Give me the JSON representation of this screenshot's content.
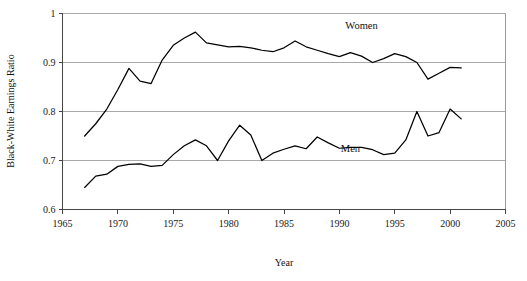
{
  "chart_data": {
    "type": "line",
    "title": "",
    "xlabel": "Year",
    "ylabel": "Black-White Earnings Ratio",
    "xlim": [
      1965,
      2005
    ],
    "ylim": [
      0.6,
      1.0
    ],
    "xticks": [
      1965,
      1970,
      1975,
      1980,
      1985,
      1990,
      1995,
      2000,
      2005
    ],
    "xtick_labels": [
      "1965",
      "1970",
      "1975",
      "1980",
      "1985",
      "1990",
      "1995",
      "2000",
      "2005"
    ],
    "yticks": [
      0.6,
      0.7,
      0.8,
      0.9,
      1.0
    ],
    "ytick_labels": [
      "0.6",
      "0.7",
      "0.8",
      "0.9",
      "1"
    ],
    "grid": "horizontal",
    "legend_position": "inline-annotation",
    "x": [
      1967,
      1968,
      1969,
      1970,
      1971,
      1972,
      1973,
      1974,
      1975,
      1976,
      1977,
      1978,
      1979,
      1980,
      1981,
      1982,
      1983,
      1984,
      1985,
      1986,
      1987,
      1988,
      1989,
      1990,
      1991,
      1992,
      1993,
      1994,
      1995,
      1996,
      1997,
      1998,
      1999,
      2000,
      2001
    ],
    "series": [
      {
        "name": "Women",
        "label": "Women",
        "color": "#000000",
        "label_x": 1992,
        "label_y": 0.968,
        "values": [
          0.75,
          0.775,
          0.805,
          0.845,
          0.888,
          0.862,
          0.857,
          0.905,
          0.935,
          0.95,
          0.962,
          0.94,
          0.936,
          0.932,
          0.933,
          0.93,
          0.925,
          0.922,
          0.93,
          0.944,
          0.932,
          0.925,
          0.918,
          0.912,
          0.92,
          0.913,
          0.9,
          0.908,
          0.918,
          0.912,
          0.9,
          0.866,
          0.878,
          0.89,
          0.889
        ]
      },
      {
        "name": "Men",
        "label": "Men",
        "color": "#000000",
        "label_x": 1991,
        "label_y": 0.718,
        "values": [
          0.645,
          0.668,
          0.672,
          0.688,
          0.692,
          0.693,
          0.688,
          0.69,
          0.712,
          0.73,
          0.742,
          0.73,
          0.7,
          0.74,
          0.772,
          0.752,
          0.7,
          0.715,
          0.723,
          0.73,
          0.724,
          0.748,
          0.736,
          0.725,
          0.727,
          0.727,
          0.722,
          0.712,
          0.715,
          0.742,
          0.8,
          0.75,
          0.757,
          0.805,
          0.785
        ]
      }
    ]
  }
}
